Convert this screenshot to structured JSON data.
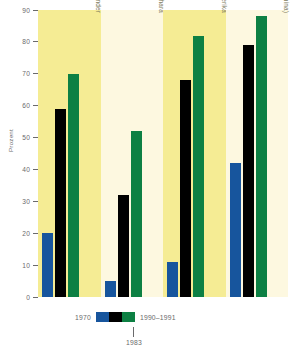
{
  "chart_data": {
    "type": "bar",
    "title": "",
    "xlabel": "",
    "ylabel": "Prozent",
    "ylim": [
      0,
      90
    ],
    "ytick_step": 10,
    "yticks": [
      90,
      80,
      70,
      60,
      50,
      40,
      30,
      20,
      10,
      0
    ],
    "grid": false,
    "legend_position": "bottom",
    "categories": [
      "Alle Entwicklungsländer",
      "Afrikanische Länder südlich der Sahara",
      "Lateinamerika",
      "Asien (ohne China)"
    ],
    "series": [
      {
        "name": "1970",
        "color": "#17559d",
        "values": [
          20,
          5,
          11,
          42
        ]
      },
      {
        "name": "1983",
        "color": "#000000",
        "values": [
          59,
          32,
          68,
          79
        ]
      },
      {
        "name": "1990–1991",
        "color": "#0d8043",
        "values": [
          70,
          52,
          82,
          88
        ]
      }
    ],
    "panel_backgrounds": [
      "#f5ec94",
      "#fdf8e0",
      "#f5ec94",
      "#fdf8e0"
    ]
  },
  "legend": {
    "left_label": "1970",
    "mid_label": "1983",
    "right_label": "1990–1991"
  }
}
